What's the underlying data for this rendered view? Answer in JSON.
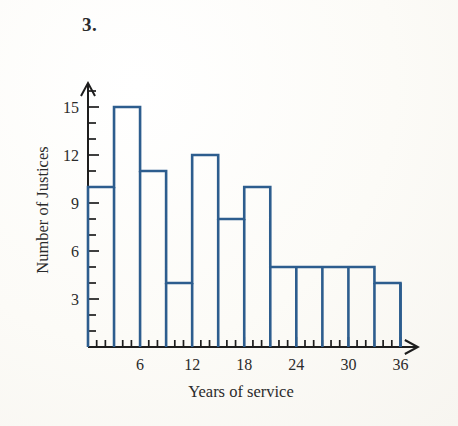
{
  "problem": {
    "number": "3."
  },
  "chart_data": {
    "type": "bar",
    "title": "",
    "xlabel": "Years of service",
    "ylabel": "Number of Justices",
    "bin_width": 3,
    "bin_starts": [
      0,
      3,
      6,
      9,
      12,
      15,
      18,
      21,
      24,
      27,
      30,
      33
    ],
    "bin_labels": [
      "0-3",
      "3-6",
      "6-9",
      "9-12",
      "12-15",
      "15-18",
      "18-21",
      "21-24",
      "24-27",
      "27-30",
      "30-33",
      "33-36"
    ],
    "categories": [
      "0-3",
      "3-6",
      "6-9",
      "9-12",
      "12-15",
      "15-18",
      "18-21",
      "21-24",
      "24-27",
      "27-30",
      "30-33",
      "33-36"
    ],
    "values": [
      10,
      15,
      11,
      4,
      12,
      8,
      10,
      5,
      5,
      5,
      5,
      4
    ],
    "xlim": [
      0,
      38
    ],
    "ylim": [
      0,
      16.5
    ],
    "x_tick_labels": [
      "6",
      "12",
      "18",
      "24",
      "30",
      "36"
    ],
    "x_tick_values": [
      6,
      12,
      18,
      24,
      30,
      36
    ],
    "x_minor_tick_step": 1,
    "y_tick_labels": [
      "3",
      "6",
      "9",
      "12",
      "15"
    ],
    "y_tick_values": [
      3,
      6,
      9,
      12,
      15
    ],
    "y_minor_tick_step": 1,
    "grid": false,
    "legend": null,
    "axis_arrows": true,
    "line_color": "#2d5d8e",
    "axis_color": "#1d1d1d",
    "background_color": "#fdfdfb"
  }
}
